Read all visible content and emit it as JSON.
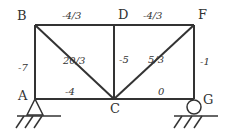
{
  "diagram": {
    "type": "truss",
    "nodes": [
      {
        "id": "A",
        "label": "A",
        "x": 35,
        "y": 99
      },
      {
        "id": "B",
        "label": "B",
        "x": 35,
        "y": 25
      },
      {
        "id": "C",
        "label": "C",
        "x": 114,
        "y": 99
      },
      {
        "id": "D",
        "label": "D",
        "x": 114,
        "y": 25
      },
      {
        "id": "F",
        "label": "F",
        "x": 194,
        "y": 25
      },
      {
        "id": "G",
        "label": "G",
        "x": 194,
        "y": 99
      }
    ],
    "members": [
      {
        "from": "B",
        "to": "D",
        "force": "-4/3"
      },
      {
        "from": "D",
        "to": "F",
        "force": "-4/3"
      },
      {
        "from": "A",
        "to": "B",
        "force": "-7"
      },
      {
        "from": "B",
        "to": "C",
        "force": "20/3"
      },
      {
        "from": "D",
        "to": "C",
        "force": "-5"
      },
      {
        "from": "F",
        "to": "C",
        "force": "5/3"
      },
      {
        "from": "F",
        "to": "G",
        "force": "-1"
      },
      {
        "from": "A",
        "to": "C",
        "force": "-4"
      },
      {
        "from": "C",
        "to": "G",
        "force": "0"
      }
    ],
    "supports": [
      {
        "node": "A",
        "type": "pin"
      },
      {
        "node": "G",
        "type": "roller"
      }
    ]
  }
}
